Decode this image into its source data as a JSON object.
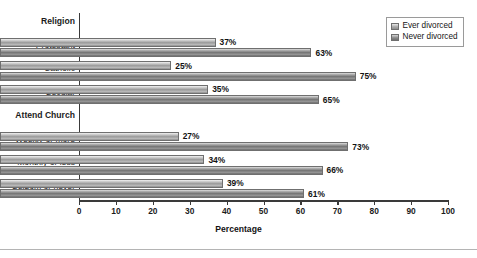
{
  "chart_data": {
    "type": "bar",
    "orientation": "horizontal",
    "title": "",
    "xlabel": "Percentage",
    "ylabel": "",
    "xlim": [
      0,
      100
    ],
    "xticks": [
      0,
      10,
      20,
      30,
      40,
      50,
      60,
      70,
      80,
      90,
      100
    ],
    "grid": false,
    "legend_position": "top-right",
    "groups": [
      {
        "heading": "Religion",
        "categories": [
          "Protestant",
          "Catholic",
          "Secular"
        ]
      },
      {
        "heading": "Attend Church",
        "categories": [
          "Weekly or more",
          "Monthly or less",
          "Seldom or never"
        ]
      }
    ],
    "categories": [
      "Protestant",
      "Catholic",
      "Secular",
      "Weekly or more",
      "Monthly or less",
      "Seldom or never"
    ],
    "series": [
      {
        "name": "Ever divorced",
        "values": [
          37,
          25,
          35,
          27,
          34,
          39
        ],
        "labels": [
          "37%",
          "25%",
          "35%",
          "27%",
          "34%",
          "39%"
        ],
        "color": "#a0a0a0"
      },
      {
        "name": "Never divorced",
        "values": [
          63,
          75,
          65,
          73,
          66,
          61
        ],
        "labels": [
          "63%",
          "75%",
          "65%",
          "73%",
          "66%",
          "61%"
        ],
        "color": "#7a7a7a"
      }
    ]
  },
  "axis": {
    "x_title": "Percentage",
    "tick_labels": [
      "0",
      "10",
      "20",
      "30",
      "40",
      "50",
      "60",
      "70",
      "80",
      "90",
      "100"
    ]
  },
  "categories": [
    {
      "label": "Religion",
      "is_heading": true,
      "ever": "",
      "never": ""
    },
    {
      "label": "Protestant",
      "is_heading": false,
      "ever": "37%",
      "never": "63%"
    },
    {
      "label": "Catholic",
      "is_heading": false,
      "ever": "25%",
      "never": "75%"
    },
    {
      "label": "Secular",
      "is_heading": false,
      "ever": "35%",
      "never": "65%"
    },
    {
      "label": "Attend Church",
      "is_heading": true,
      "ever": "",
      "never": ""
    },
    {
      "label": "Weekly or more",
      "is_heading": false,
      "ever": "27%",
      "never": "73%"
    },
    {
      "label": "Monthly or less",
      "is_heading": false,
      "ever": "34%",
      "never": "66%"
    },
    {
      "label": "Seldom or never",
      "is_heading": false,
      "ever": "39%",
      "never": "61%"
    }
  ],
  "legend": {
    "items": [
      {
        "label": "Ever divorced",
        "key": "ever"
      },
      {
        "label": "Never divorced",
        "key": "never"
      }
    ]
  },
  "colors": {
    "ever_divorced": "#a0a0a0",
    "never_divorced": "#7a7a7a",
    "axis": "#3a3a3a",
    "text": "#121212"
  }
}
